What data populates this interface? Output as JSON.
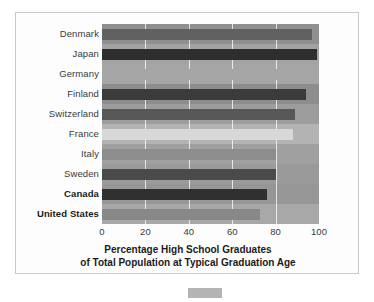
{
  "figure": {
    "frame_color": "#c9c9c9",
    "plot_background": "#9a9a9a",
    "gridline_color": "#ffffff"
  },
  "axis_title": {
    "line1": "Percentage High School Graduates",
    "line2": "of Total Population at Typical Graduation Age"
  },
  "x_axis": {
    "ticks": [
      "0",
      "20",
      "40",
      "60",
      "80",
      "100"
    ]
  },
  "bottom_swatch": {
    "color": "#b4b4b4"
  },
  "chart_data": {
    "type": "bar",
    "orientation": "horizontal",
    "title": "Percentage High School Graduates of Total Population at Typical Graduation Age",
    "xlabel": "Percentage High School Graduates of Total Population at Typical Graduation Age",
    "ylabel": "",
    "xlim": [
      0,
      100
    ],
    "ylim": null,
    "grid": true,
    "gridlines_x": [
      0,
      20,
      40,
      60,
      80,
      100
    ],
    "legend": null,
    "categories": [
      "Denmark",
      "Japan",
      "Germany",
      "Finland",
      "Switzerland",
      "France",
      "Italy",
      "Sweden",
      "Canada",
      "United States"
    ],
    "values": [
      97,
      99,
      95,
      94,
      89,
      88,
      80,
      80,
      76,
      73
    ],
    "bars": [
      {
        "label": "Denmark",
        "value": 97,
        "color": "#616161",
        "bold_label": false,
        "band": "#8f8f8f"
      },
      {
        "label": "Japan",
        "value": 99,
        "color": "#2e2e2e",
        "bold_label": false,
        "band": "#a3a3a3"
      },
      {
        "label": "Germany",
        "value": 95,
        "color": "#a6a6a6",
        "bold_label": false,
        "band": "#a6a6a6"
      },
      {
        "label": "Finland",
        "value": 94,
        "color": "#3b3b3b",
        "bold_label": false,
        "band": "#8d8d8d"
      },
      {
        "label": "Switzerland",
        "value": 89,
        "color": "#575757",
        "bold_label": false,
        "band": "#9d9d9d"
      },
      {
        "label": "France",
        "value": 88,
        "color": "#d8d8d8",
        "bold_label": false,
        "band": "#b3b3b3"
      },
      {
        "label": "Italy",
        "value": 80,
        "color": "#8d8d8d",
        "bold_label": false,
        "band": "#a0a0a0"
      },
      {
        "label": "Sweden",
        "value": 80,
        "color": "#4a4a4a",
        "bold_label": false,
        "band": "#9a9a9a"
      },
      {
        "label": "Canada",
        "value": 76,
        "color": "#303030",
        "bold_label": true,
        "band": "#969696"
      },
      {
        "label": "United States",
        "value": 73,
        "color": "#888888",
        "bold_label": true,
        "band": "#a8a8a8"
      }
    ]
  }
}
